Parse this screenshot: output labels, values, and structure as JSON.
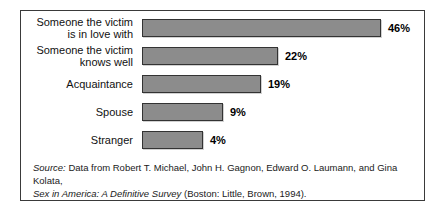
{
  "chart_data": {
    "type": "bar",
    "orientation": "horizontal",
    "title": "",
    "subtitle": "",
    "xlabel": "",
    "ylabel": "",
    "grid": false,
    "legend": null,
    "value_suffix": "%",
    "categories": [
      "Someone the victim\nis in love with",
      "Someone the victim\nknows well",
      "Acquaintance",
      "Spouse",
      "Stranger"
    ],
    "values": [
      46,
      22,
      19,
      9,
      4
    ],
    "value_labels": [
      "46%",
      "22%",
      "19%",
      "9%",
      "4%"
    ],
    "bar_color": "#8c8c8c",
    "bar_border_color": "#333333",
    "bars": [
      {
        "label": "Someone the victim\nis in love with",
        "value": 46,
        "value_label": "46%",
        "px_width": 239
      },
      {
        "label": "Someone the victim\nknows well",
        "value": 22,
        "value_label": "22%",
        "px_width": 136
      },
      {
        "label": "Acquaintance",
        "value": 19,
        "value_label": "19%",
        "px_width": 119
      },
      {
        "label": "Spouse",
        "value": 9,
        "value_label": "9%",
        "px_width": 81
      },
      {
        "label": "Stranger",
        "value": 4,
        "value_label": "4%",
        "px_width": 61
      }
    ]
  },
  "source": {
    "lead_italic": "Source:",
    "line1_rest": " Data from Robert T. Michael, John H. Gagnon, Edward O. Laumann, and Gina Kolata,",
    "line2_italic": "Sex in America: A Definitive Survey",
    "line2_rest": " (Boston: Little, Brown, 1994)."
  }
}
